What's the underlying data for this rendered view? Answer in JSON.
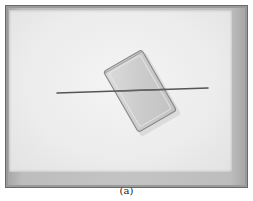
{
  "figure": {
    "caption": "(a)",
    "colors": {
      "frame": "#9a9a9a",
      "panel": "#ededed",
      "block_fill": "#cfcfcf",
      "block_edge": "#8a8a8a",
      "rod": "#555555"
    }
  }
}
